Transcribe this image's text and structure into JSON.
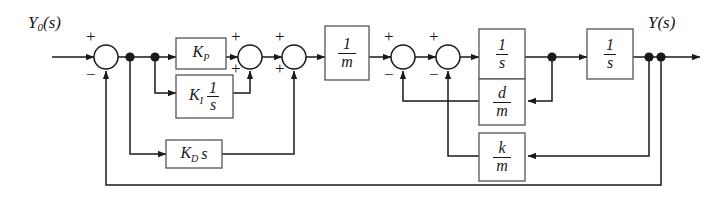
{
  "diagram": {
    "type": "control-system-block-diagram",
    "stroke_color": "#1a1a1a",
    "background": "#ffffff",
    "io": {
      "input_label": "Y",
      "input_sub": "0",
      "input_suffix": "(s)",
      "output_label": "Y(s)"
    },
    "blocks": [
      {
        "id": "kp",
        "name": "proportional-gain-block",
        "kind": "gain",
        "label": "K",
        "sub": "P",
        "suffix": "",
        "num": "",
        "den": ""
      },
      {
        "id": "ki",
        "name": "integral-gain-block",
        "kind": "gain-frac",
        "label": "K",
        "sub": "I",
        "suffix": "",
        "num": "1",
        "den": "s"
      },
      {
        "id": "kd",
        "name": "derivative-gain-block",
        "kind": "gain",
        "label": "K",
        "sub": "D",
        "suffix": "s",
        "num": "",
        "den": ""
      },
      {
        "id": "invm",
        "name": "inverse-mass-block",
        "kind": "frac",
        "label": "",
        "sub": "",
        "suffix": "",
        "num": "1",
        "den": "m"
      },
      {
        "id": "int1",
        "name": "first-integrator-block",
        "kind": "frac",
        "label": "",
        "sub": "",
        "suffix": "",
        "num": "1",
        "den": "s"
      },
      {
        "id": "int2",
        "name": "second-integrator-block",
        "kind": "frac",
        "label": "",
        "sub": "",
        "suffix": "",
        "num": "1",
        "den": "s"
      },
      {
        "id": "dm",
        "name": "damping-feedback-block",
        "kind": "frac",
        "label": "",
        "sub": "",
        "suffix": "",
        "num": "d",
        "den": "m"
      },
      {
        "id": "km",
        "name": "stiffness-feedback-block",
        "kind": "frac",
        "label": "",
        "sub": "",
        "suffix": "",
        "num": "k",
        "den": "m"
      }
    ],
    "summing_junctions": [
      {
        "id": "sum1",
        "name": "error-summing-junction",
        "top_sign": "+",
        "bottom_sign": "−"
      },
      {
        "id": "sum2",
        "name": "pi-summing-junction",
        "top_sign": "+",
        "bottom_sign": "+"
      },
      {
        "id": "sum3",
        "name": "pid-summing-junction",
        "top_sign": "+",
        "bottom_sign": "+"
      },
      {
        "id": "sum4",
        "name": "force-summing-junction",
        "top_sign": "+",
        "bottom_sign": "−"
      },
      {
        "id": "sum5",
        "name": "accel-summing-junction",
        "top_sign": "+",
        "bottom_sign": "−"
      }
    ],
    "nodes": [
      {
        "id": "n1",
        "name": "error-branch-node-1"
      },
      {
        "id": "n2",
        "name": "error-branch-node-2"
      },
      {
        "id": "n3",
        "name": "velocity-node"
      },
      {
        "id": "n4",
        "name": "output-node-1"
      },
      {
        "id": "n5",
        "name": "output-node-2"
      }
    ]
  }
}
